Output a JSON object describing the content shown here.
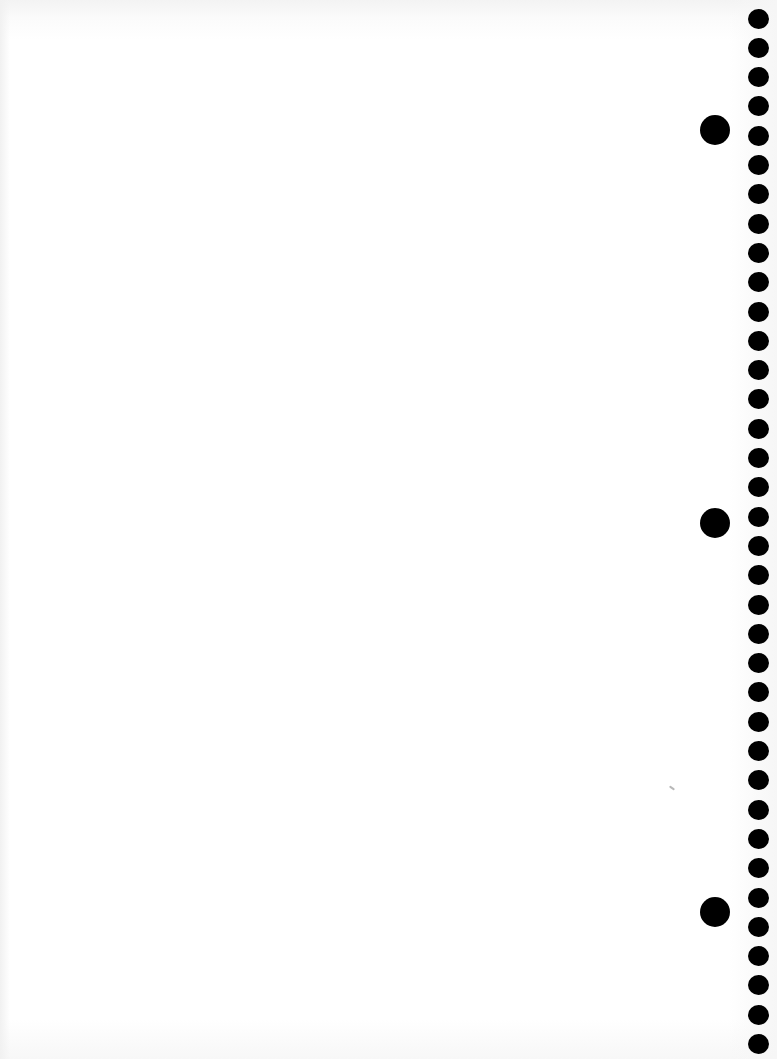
{
  "document": {
    "type": "blank-notebook-page",
    "background_color": "#ffffff",
    "hole_color": "#000000"
  },
  "spiral_holes": {
    "center_x": 758,
    "first_center_y": 19,
    "pitch": 29.3,
    "count": 36,
    "diameter": 21
  },
  "binder_holes": [
    {
      "center_x": 715,
      "center_y": 130
    },
    {
      "center_x": 715,
      "center_y": 523
    },
    {
      "center_x": 715,
      "center_y": 912
    }
  ],
  "marks": [
    {
      "x": 669,
      "y": 787
    }
  ]
}
